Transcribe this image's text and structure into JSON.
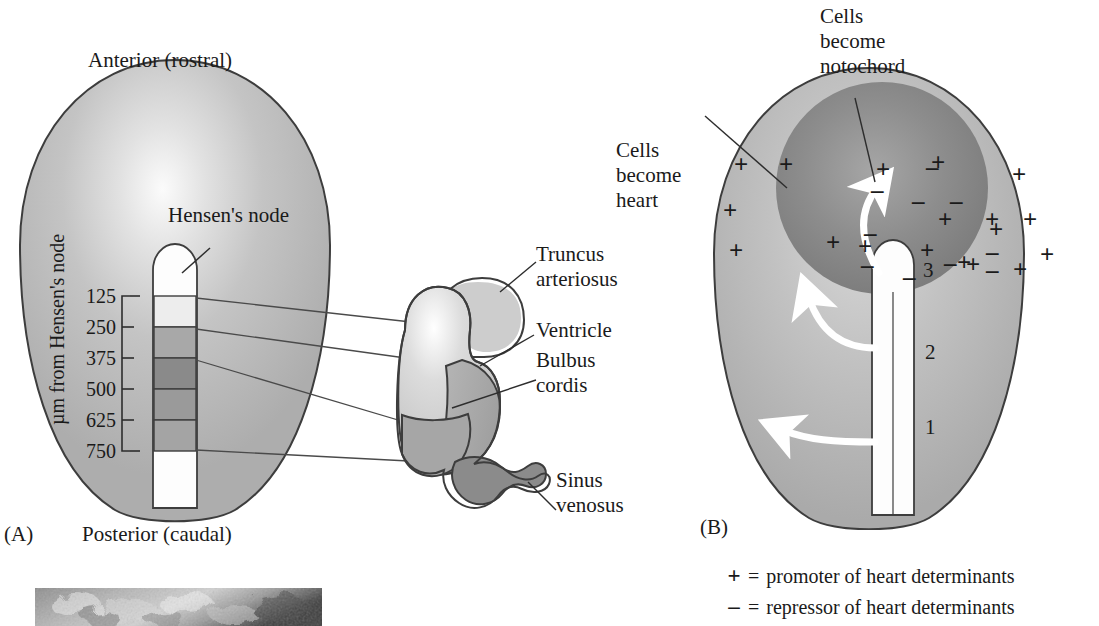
{
  "figure": {
    "domain": "biology-embryology-diagram",
    "panels": [
      {
        "id": "A",
        "label": "(A)"
      },
      {
        "id": "B",
        "label": "(B)"
      }
    ]
  },
  "panel_a": {
    "panel_label": "(A)",
    "top_label": "Anterior (rostral)",
    "bottom_label": "Posterior (caudal)",
    "node_label": "Hensen's node",
    "axis_label": "µm from Hensen's node",
    "scale_ticks": [
      "125",
      "250",
      "375",
      "500",
      "625",
      "750"
    ],
    "scale_unit": "µm",
    "heart_labels": [
      {
        "name": "truncus-arteriosus",
        "text": "Truncus\narteriosus",
        "lines": [
          "Truncus",
          "arteriosus"
        ]
      },
      {
        "name": "ventricle",
        "text": "Ventricle",
        "lines": [
          "Ventricle"
        ]
      },
      {
        "name": "bulbus-cordis",
        "text": "Bulbus\ncordis",
        "lines": [
          "Bulbus",
          "cordis"
        ]
      },
      {
        "name": "sinus-venosus",
        "text": "Sinus\nvenosus",
        "lines": [
          "Sinus",
          "venosus"
        ]
      }
    ]
  },
  "panel_b": {
    "panel_label": "(B)",
    "callout_notochord": {
      "lines": [
        "Cells",
        "become",
        "notochord"
      ],
      "text": "Cells become notochord"
    },
    "callout_heart": {
      "lines": [
        "Cells",
        "become",
        "heart"
      ],
      "text": "Cells become heart"
    },
    "streak_stages": [
      "3",
      "2",
      "1"
    ],
    "plus_symbol": "+",
    "minus_symbol": "–",
    "outer_plus_count": 13,
    "inner_plus_count": 8,
    "inner_minus_count": 15
  },
  "legend": {
    "items": [
      {
        "symbol": "+",
        "equals": "=",
        "text": "promoter of heart determinants"
      },
      {
        "symbol": "–",
        "equals": "=",
        "text": "repressor of heart determinants"
      }
    ]
  },
  "micrograph": {
    "name": "scanning-electron-micrograph",
    "caption": ""
  },
  "colors": {
    "embryo_base": "#b9b9b9",
    "embryo_light": "#f4f4f4",
    "band_125": "#ededed",
    "band_250": "#a8a8a8",
    "band_375": "#8a8a8a",
    "band_500": "#9a9a9a",
    "band_625": "#a4a4a4",
    "streak_white": "#fdfdfd",
    "outline": "#3a3a3a",
    "heart_light": "#cfcfcf",
    "heart_mid": "#a9a9a9",
    "heart_dark": "#8d8d8d",
    "notochord_disc": "#8f8f8f",
    "arrow_white": "#ffffff",
    "text": "#1a1a1a"
  }
}
